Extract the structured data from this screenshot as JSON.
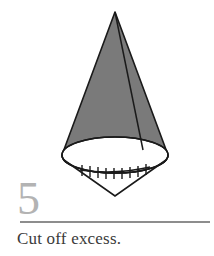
{
  "step": {
    "number": "5",
    "caption": "Cut off excess."
  },
  "illustration": {
    "name": "cone-with-excess-fabric",
    "description": "Shaded cone viewed from the side with an elliptical open base, a seam line running from the apex to the base, and a V-shaped excess fabric flap below the base marked with a row of stitch ticks",
    "colors": {
      "cone_fill": "#7a7a7a",
      "outline": "#1a1a1a",
      "base_fill": "#ffffff",
      "background": "#ffffff",
      "step_number": "#b3b3b3",
      "rule": "#8d8d8d",
      "caption_text": "#3a3a3a"
    },
    "geometry": {
      "apex": [
        115,
        12
      ],
      "base_center": [
        115,
        155
      ],
      "base_rx": 53,
      "base_ry": 18,
      "left_base_point": [
        62,
        155
      ],
      "right_base_point": [
        168,
        155
      ],
      "seam_base_point": [
        143,
        150
      ],
      "excess_v_point": [
        115,
        196
      ],
      "stitch_line_left": [
        80,
        170
      ],
      "stitch_line_right": [
        150,
        167
      ],
      "stitch_count": 9
    }
  }
}
